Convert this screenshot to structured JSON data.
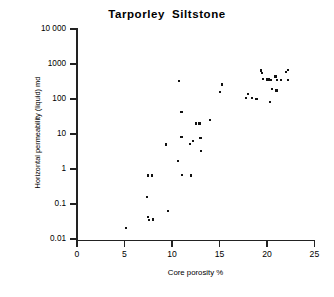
{
  "chart_data": {
    "type": "scatter",
    "title": "Tarporley  Siltstone",
    "xlabel": "Core porosity %",
    "ylabel": "Horizontal permeability (liquid) md",
    "xlim": [
      0,
      25
    ],
    "ylim": [
      0.01,
      10000
    ],
    "yscale": "log",
    "xscale": "linear",
    "grid": false,
    "legend": null,
    "xticks": [
      "0",
      "5",
      "10",
      "15",
      "20",
      "25"
    ],
    "xtick_values": [
      0,
      5,
      10,
      15,
      20,
      25
    ],
    "yticks": [
      "0.01",
      "0.1",
      "1",
      "10",
      "100",
      "1000",
      "10 000"
    ],
    "ytick_values": [
      0.01,
      0.1,
      1,
      10,
      100,
      1000,
      10000
    ],
    "marker": "square",
    "marker_color": "#111111",
    "points": [
      {
        "x": 5.2,
        "y": 0.021
      },
      {
        "x": 7.4,
        "y": 0.16
      },
      {
        "x": 7.5,
        "y": 0.65
      },
      {
        "x": 7.5,
        "y": 0.043
      },
      {
        "x": 7.6,
        "y": 0.035
      },
      {
        "x": 7.9,
        "y": 0.65
      },
      {
        "x": 8.0,
        "y": 0.036
      },
      {
        "x": 9.4,
        "y": 5.0
      },
      {
        "x": 9.6,
        "y": 0.062
      },
      {
        "x": 10.6,
        "y": 1.7
      },
      {
        "x": 10.7,
        "y": 330
      },
      {
        "x": 11.0,
        "y": 43
      },
      {
        "x": 11.0,
        "y": 8.0
      },
      {
        "x": 11.1,
        "y": 0.66
      },
      {
        "x": 11.9,
        "y": 5.2
      },
      {
        "x": 12.0,
        "y": 0.65
      },
      {
        "x": 12.2,
        "y": 6.4
      },
      {
        "x": 12.5,
        "y": 20
      },
      {
        "x": 12.9,
        "y": 20
      },
      {
        "x": 13.0,
        "y": 7.8
      },
      {
        "x": 13.1,
        "y": 3.2
      },
      {
        "x": 14.0,
        "y": 25
      },
      {
        "x": 15.1,
        "y": 160
      },
      {
        "x": 15.3,
        "y": 260
      },
      {
        "x": 17.8,
        "y": 105
      },
      {
        "x": 18.0,
        "y": 140
      },
      {
        "x": 18.4,
        "y": 105
      },
      {
        "x": 18.9,
        "y": 100
      },
      {
        "x": 19.4,
        "y": 650
      },
      {
        "x": 19.5,
        "y": 540
      },
      {
        "x": 19.6,
        "y": 380
      },
      {
        "x": 20.0,
        "y": 360
      },
      {
        "x": 20.2,
        "y": 360
      },
      {
        "x": 20.3,
        "y": 82
      },
      {
        "x": 20.4,
        "y": 350
      },
      {
        "x": 20.5,
        "y": 195
      },
      {
        "x": 20.9,
        "y": 440
      },
      {
        "x": 21.0,
        "y": 175
      },
      {
        "x": 21.1,
        "y": 350
      },
      {
        "x": 21.5,
        "y": 350
      },
      {
        "x": 22.0,
        "y": 590
      },
      {
        "x": 22.2,
        "y": 670
      },
      {
        "x": 22.2,
        "y": 350
      }
    ]
  },
  "axes": {
    "x_ticks": [
      {
        "label": "0",
        "value": 0
      },
      {
        "label": "5",
        "value": 5
      },
      {
        "label": "10",
        "value": 10
      },
      {
        "label": "15",
        "value": 15
      },
      {
        "label": "20",
        "value": 20
      },
      {
        "label": "25",
        "value": 25
      }
    ],
    "y_ticks": [
      {
        "label": "10 000",
        "value": 10000
      },
      {
        "label": "1000",
        "value": 1000
      },
      {
        "label": "100",
        "value": 100
      },
      {
        "label": "10",
        "value": 10
      },
      {
        "label": "1",
        "value": 1
      },
      {
        "label": "0.1",
        "value": 0.1
      },
      {
        "label": "0.01",
        "value": 0.01
      }
    ]
  }
}
